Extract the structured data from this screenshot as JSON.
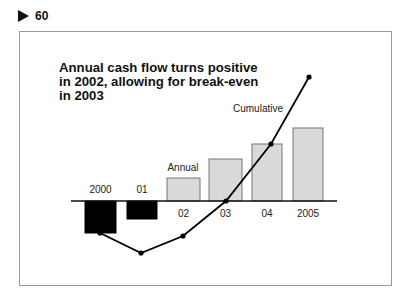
{
  "exhibit": {
    "number": "60",
    "icon": "triangle-right-icon"
  },
  "chart_data": {
    "type": "bar+line",
    "title": "Annual cash flow turns positive in 2002, allowing for break-even in 2003",
    "categories": [
      "2000",
      "01",
      "02",
      "03",
      "04",
      "2005"
    ],
    "series": [
      {
        "name": "Annual",
        "type": "bar",
        "values": [
          -32,
          -18,
          23,
          42,
          57,
          73
        ],
        "colors": [
          "#000000",
          "#000000",
          "#d9d9d9",
          "#d9d9d9",
          "#d9d9d9",
          "#d9d9d9"
        ]
      },
      {
        "name": "Cumulative",
        "type": "line",
        "values": [
          -32,
          -52,
          -35,
          0,
          57,
          124
        ],
        "color": "#000000"
      }
    ],
    "annotations": [
      "Annual",
      "Cumulative"
    ],
    "xlabel": "",
    "ylabel": "",
    "units": "relative (no y-axis scale shown)",
    "grid": false,
    "legend": "inline labels"
  },
  "labels": {
    "title_line1": "Annual cash flow turns positive",
    "title_line2": "in 2002, allowing for break-even",
    "title_line3": "in 2003",
    "annual": "Annual",
    "cumulative": "Cumulative"
  }
}
